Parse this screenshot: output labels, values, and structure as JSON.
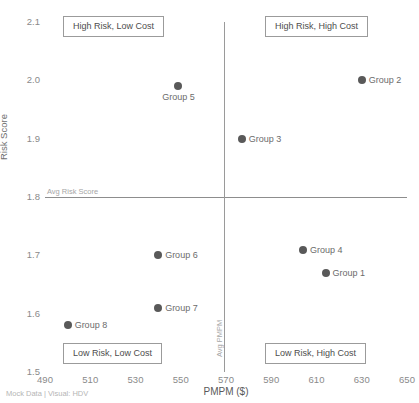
{
  "footer": {
    "note": "Mock Data | Visual: HDV"
  },
  "chart_data": {
    "type": "scatter",
    "title": "",
    "xlabel": "PMPM ($)",
    "ylabel": "Risk Score",
    "xlim": [
      490,
      650
    ],
    "ylim": [
      1.5,
      2.1
    ],
    "xticks": [
      490,
      510,
      530,
      550,
      570,
      590,
      610,
      630,
      650
    ],
    "yticks": [
      "2.1",
      "2.0",
      "1.9",
      "1.8",
      "1.7",
      "1.6",
      "1.5"
    ],
    "grid": false,
    "legend": "none",
    "marker_color": "#595959",
    "reference_lines": [
      {
        "orientation": "horizontal",
        "label": "Avg Risk Score",
        "value": 1.8
      },
      {
        "orientation": "vertical",
        "label": "Avg PMPM",
        "value": 569
      }
    ],
    "quadrant_labels": [
      {
        "text": "High Risk, Low Cost",
        "position": "top-left"
      },
      {
        "text": "High Risk, High Cost",
        "position": "top-right"
      },
      {
        "text": "Low Risk, Low Cost",
        "position": "bottom-left"
      },
      {
        "text": "Low Risk, High Cost",
        "position": "bottom-right"
      }
    ],
    "points": [
      {
        "label": "Group 2",
        "x": 630,
        "y": 2.0,
        "label_pos": "right"
      },
      {
        "label": "Group 5",
        "x": 549,
        "y": 1.99,
        "label_pos": "below"
      },
      {
        "label": "Group 3",
        "x": 577,
        "y": 1.9,
        "label_pos": "right"
      },
      {
        "label": "Group 4",
        "x": 604,
        "y": 1.71,
        "label_pos": "right"
      },
      {
        "label": "Group 6",
        "x": 540,
        "y": 1.7,
        "label_pos": "right"
      },
      {
        "label": "Group 1",
        "x": 614,
        "y": 1.67,
        "label_pos": "right"
      },
      {
        "label": "Group 7",
        "x": 540,
        "y": 1.61,
        "label_pos": "right"
      },
      {
        "label": "Group 8",
        "x": 500,
        "y": 1.58,
        "label_pos": "right"
      }
    ]
  }
}
